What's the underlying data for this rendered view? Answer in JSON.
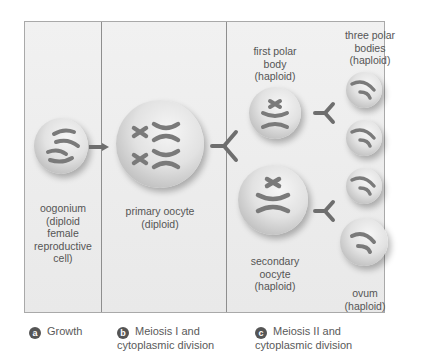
{
  "cells": {
    "oogonium": {
      "label": "oogonium\n(diploid\nfemale\nreproductive\ncell)"
    },
    "primary_oocyte": {
      "label": "primary oocyte\n(diploid)"
    },
    "first_polar_body": {
      "label": "first polar\nbody\n(haploid)"
    },
    "secondary_oocyte": {
      "label": "secondary\noocyte\n(haploid)"
    },
    "three_polar_bodies": {
      "label": "three polar\nbodies\n(haploid)"
    },
    "ovum": {
      "label": "ovum\n(haploid)"
    }
  },
  "steps": [
    {
      "badge": "a",
      "label": "Growth"
    },
    {
      "badge": "b",
      "label": "Meiosis I and\ncytoplasmic division"
    },
    {
      "badge": "c",
      "label": "Meiosis II and\ncytoplasmic division"
    }
  ],
  "colors": {
    "panel_border": "#a9a9a9",
    "divider": "#8e8e8e",
    "chromosome": "#7a7a7a",
    "arrow": "#6e6e6e",
    "badge": "#555555"
  }
}
